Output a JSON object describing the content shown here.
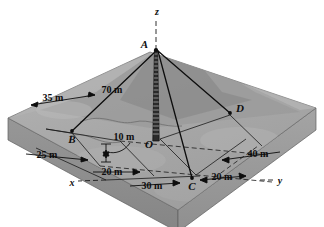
{
  "figure": {
    "type": "engineering-diagram",
    "background_color": "#ffffff"
  },
  "colors": {
    "ground_top": "#a8a8a8",
    "ground_top_light": "#b9b9b9",
    "ground_side": "#8d8d8d",
    "ground_front": "#9c9c9c",
    "hill_dark": "#939393",
    "hill_mid": "#a0a0a0",
    "hill_light": "#bdbdbd",
    "line": "#0d0d0d",
    "tower_fill": "#1a1a1a",
    "dashed": "#1a1a1a"
  },
  "points": {
    "A": {
      "label": "A",
      "x": 156,
      "y": 47
    },
    "O": {
      "label": "O",
      "x": 160,
      "y": 139
    },
    "B": {
      "label": "B",
      "x": 72,
      "y": 133
    },
    "C": {
      "label": "C",
      "x": 192,
      "y": 180
    },
    "D": {
      "label": "D",
      "x": 230,
      "y": 113
    }
  },
  "axes": {
    "z": {
      "label": "z",
      "x": 157,
      "y": 13
    },
    "x": {
      "label": "x",
      "x": 72,
      "y": 185
    },
    "y": {
      "label": "y",
      "x": 278,
      "y": 183
    }
  },
  "dimensions": [
    {
      "name": "tower-height",
      "label": "70 m",
      "x": 110,
      "y": 90
    },
    {
      "name": "offset-ob",
      "label": "35 m",
      "x": 52,
      "y": 104
    },
    {
      "name": "offset-x-b",
      "label": "25 m",
      "x": 52,
      "y": 159
    },
    {
      "name": "offset-base",
      "label": "10 m",
      "x": 114,
      "y": 139
    },
    {
      "name": "offset-x-o",
      "label": "20 m",
      "x": 110,
      "y": 174
    },
    {
      "name": "offset-oc",
      "label": "30 m",
      "x": 148,
      "y": 185
    },
    {
      "name": "offset-c-y",
      "label": "20 m",
      "x": 216,
      "y": 178
    },
    {
      "name": "offset-d-y",
      "label": "40 m",
      "x": 256,
      "y": 156
    }
  ],
  "cables": [
    {
      "name": "cable-AB",
      "from": "A",
      "to": "B"
    },
    {
      "name": "cable-AC",
      "from": "A",
      "to": "C"
    },
    {
      "name": "cable-AD",
      "from": "A",
      "to": "D"
    }
  ],
  "tower": {
    "name": "lattice-tower",
    "rungs": 21,
    "top_x": 156,
    "top_y": 50,
    "bottom_y": 140
  }
}
